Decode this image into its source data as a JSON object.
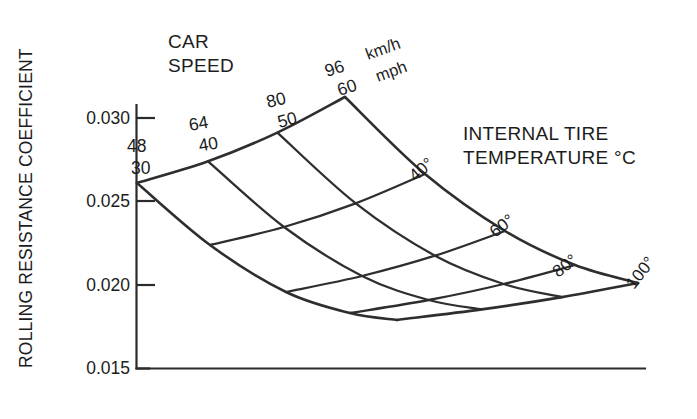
{
  "chart_data": {
    "type": "line",
    "title": "",
    "subtitle": "",
    "ylabel": "ROLLING RESISTANCE COEFFICIENT",
    "xlabel": "",
    "ylim": [
      0.015,
      0.0315
    ],
    "yticks": [
      "0.015",
      "0.020",
      "0.025",
      "0.030"
    ],
    "ytick_values": [
      0.015,
      0.02,
      0.025,
      0.03
    ],
    "grid": false,
    "legend_position": "none",
    "surface_axis_1": {
      "name": "CAR SPEED",
      "unit_primary": "km/h",
      "unit_secondary": "mph",
      "levels": [
        {
          "kmh": "48",
          "mph": "30"
        },
        {
          "kmh": "64",
          "mph": "40"
        },
        {
          "kmh": "80",
          "mph": "50"
        },
        {
          "kmh": "96",
          "mph": "60"
        }
      ]
    },
    "surface_axis_2": {
      "name": "INTERNAL TIRE TEMPERATURE °C",
      "levels": [
        "30°",
        "40°",
        "60°",
        "80°",
        "100°"
      ],
      "level_values": [
        30,
        40,
        60,
        80,
        100
      ]
    },
    "series": [
      {
        "name": "48 km/h (30 mph)",
        "temperatures": [
          30,
          40,
          60,
          80,
          100
        ],
        "values": [
          0.0262,
          0.0228,
          0.0205,
          0.0193,
          0.0189
        ]
      },
      {
        "name": "64 km/h (40 mph)",
        "temperatures": [
          30,
          40,
          60,
          80,
          100
        ],
        "values": [
          0.0275,
          0.0236,
          0.0209,
          0.0195,
          0.0191
        ]
      },
      {
        "name": "80 km/h (50 mph)",
        "temperatures": [
          30,
          40,
          60,
          80,
          100
        ],
        "values": [
          0.0291,
          0.0246,
          0.0214,
          0.0198,
          0.0194
        ]
      },
      {
        "name": "96 km/h (60 mph)",
        "temperatures": [
          30,
          40,
          60,
          80,
          100
        ],
        "values": [
          0.0305,
          0.0256,
          0.022,
          0.0203,
          0.0199
        ]
      }
    ]
  },
  "axis": {
    "y_title": "ROLLING RESISTANCE COEFFICIENT",
    "ticks": [
      {
        "label": "0.030"
      },
      {
        "label": "0.025"
      },
      {
        "label": "0.020"
      },
      {
        "label": "0.015"
      }
    ]
  },
  "headings": {
    "car_speed_line1": "CAR",
    "car_speed_line2": "SPEED",
    "temperature_line1": "INTERNAL TIRE",
    "temperature_line2": "TEMPERATURE °C"
  },
  "speed_labels": [
    {
      "kmh": "48",
      "mph": "30"
    },
    {
      "kmh": "64",
      "mph": "40"
    },
    {
      "kmh": "80",
      "mph": "50"
    },
    {
      "kmh": "96",
      "mph": "60"
    }
  ],
  "unit_labels": {
    "kmh": "km/h",
    "mph": "mph"
  },
  "temp_labels": [
    {
      "text": "40°"
    },
    {
      "text": "60°"
    },
    {
      "text": "80°"
    },
    {
      "text": "100°"
    }
  ],
  "colors": {
    "line": "#2e2e2e",
    "text": "#1c1c1c",
    "background": "#ffffff"
  }
}
